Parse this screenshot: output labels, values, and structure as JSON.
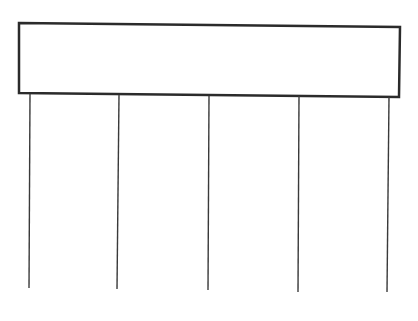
{
  "diagram": {
    "colors": {
      "background": "#ffffff",
      "stroke": "#2b2b2b",
      "line": "#3a3a3a"
    },
    "box": {
      "label": "",
      "top_left": [
        19,
        23
      ],
      "top_right": [
        400,
        27
      ],
      "bottom_right": [
        399,
        97
      ],
      "bottom_left": [
        19,
        93
      ],
      "stroke_width": 2.5
    },
    "lines": [
      {
        "x_top": 30,
        "y_top": 94,
        "x_bottom": 29,
        "y_bottom": 288
      },
      {
        "x_top": 119,
        "y_top": 95,
        "x_bottom": 117,
        "y_bottom": 289
      },
      {
        "x_top": 209,
        "y_top": 96,
        "x_bottom": 208,
        "y_bottom": 290
      },
      {
        "x_top": 299,
        "y_top": 96,
        "x_bottom": 298,
        "y_bottom": 292
      },
      {
        "x_top": 389,
        "y_top": 97,
        "x_bottom": 387,
        "y_bottom": 292
      }
    ]
  }
}
